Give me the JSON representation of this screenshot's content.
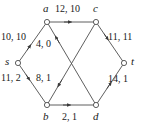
{
  "figure": {
    "type": "flow-network-diagram",
    "stroke_color": "#4d4d4d",
    "text_color": "#1a1a1a",
    "background": "#ffffff"
  },
  "nodes": [
    {
      "id": "s",
      "label": "s",
      "x": 18,
      "y": 63
    },
    {
      "id": "a",
      "label": "a",
      "x": 47,
      "y": 22
    },
    {
      "id": "b",
      "label": "b",
      "x": 47,
      "y": 105
    },
    {
      "id": "c",
      "label": "c",
      "x": 96,
      "y": 22
    },
    {
      "id": "d",
      "label": "d",
      "x": 96,
      "y": 105
    },
    {
      "id": "t",
      "label": "t",
      "x": 124,
      "y": 63
    }
  ],
  "node_labels": [
    {
      "name": "node-label-s",
      "text": "s",
      "x": 5,
      "y": 58
    },
    {
      "name": "node-label-a",
      "text": "a",
      "x": 43,
      "y": 4
    },
    {
      "name": "node-label-c",
      "text": "c",
      "x": 93,
      "y": 4
    },
    {
      "name": "node-label-t",
      "text": "t",
      "x": 131,
      "y": 58
    },
    {
      "name": "node-label-b",
      "text": "b",
      "x": 43,
      "y": 112
    },
    {
      "name": "node-label-d",
      "text": "d",
      "x": 93,
      "y": 112
    }
  ],
  "edges": [
    {
      "id": "s-a",
      "from": "s",
      "to": "a",
      "capacity": 10,
      "flow": 10,
      "label": "10, 10"
    },
    {
      "id": "s-b",
      "from": "s",
      "to": "b",
      "capacity": 11,
      "flow": 2,
      "label": "11, 2"
    },
    {
      "id": "a-c",
      "from": "a",
      "to": "c",
      "capacity": 12,
      "flow": 10,
      "label": "12, 10"
    },
    {
      "id": "d-a",
      "from": "d",
      "to": "a",
      "capacity": 4,
      "flow": 0,
      "label": "4, 0"
    },
    {
      "id": "c-b",
      "from": "c",
      "to": "b",
      "capacity": 8,
      "flow": 1,
      "label": "8, 1"
    },
    {
      "id": "b-d",
      "from": "b",
      "to": "d",
      "capacity": 2,
      "flow": 1,
      "label": "2, 1"
    },
    {
      "id": "c-t",
      "from": "c",
      "to": "t",
      "capacity": 11,
      "flow": 11,
      "label": "11, 11"
    },
    {
      "id": "d-t",
      "from": "d",
      "to": "t",
      "capacity": 14,
      "flow": 1,
      "label": "14, 1"
    }
  ],
  "edge_labels": [
    {
      "name": "edge-label-s-a",
      "text": "10, 10",
      "x": 2,
      "y": 32
    },
    {
      "name": "edge-label-s-b",
      "text": "11, 2",
      "x": 2,
      "y": 73
    },
    {
      "name": "edge-label-a-c",
      "text": "12, 10",
      "x": 54,
      "y": 4
    },
    {
      "name": "edge-label-d-a",
      "text": "4, 0",
      "x": 36,
      "y": 39
    },
    {
      "name": "edge-label-c-b",
      "text": "8, 1",
      "x": 36,
      "y": 73
    },
    {
      "name": "edge-label-b-d",
      "text": "2, 1",
      "x": 62,
      "y": 112
    },
    {
      "name": "edge-label-c-t",
      "text": "11, 11",
      "x": 108,
      "y": 32
    },
    {
      "name": "edge-label-d-t",
      "text": "14, 1",
      "x": 108,
      "y": 74
    }
  ]
}
